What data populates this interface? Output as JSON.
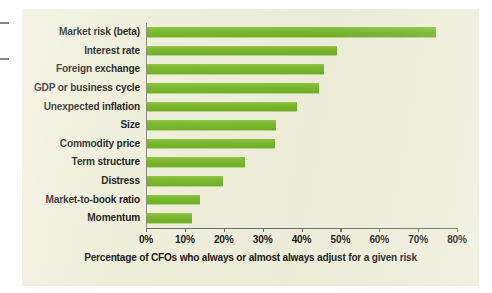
{
  "chart_data": {
    "type": "bar",
    "orientation": "horizontal",
    "title": "",
    "xlabel": "Percentage of CFOs who always or almost always adjust for a given risk",
    "ylabel": "",
    "xlim": [
      0,
      80
    ],
    "xticks": [
      0,
      10,
      20,
      30,
      40,
      50,
      60,
      70,
      80
    ],
    "xtick_labels": [
      "0%",
      "10%",
      "20%",
      "30%",
      "40%",
      "50%",
      "60%",
      "70%",
      "80%"
    ],
    "grid": false,
    "legend": null,
    "bar_color": "#7ab72e",
    "background_color": "#efeeda",
    "categories": [
      "Market risk (beta)",
      "Interest rate",
      "Foreign exchange",
      "GDP or business cycle",
      "Unexpected inflation",
      "Size",
      "Commodity price",
      "Term structure",
      "Distress",
      "Market-to-book ratio",
      "Momentum"
    ],
    "values": [
      74.5,
      49.2,
      45.8,
      44.5,
      38.9,
      33.5,
      33.2,
      25.4,
      19.9,
      14.0,
      11.9
    ]
  }
}
